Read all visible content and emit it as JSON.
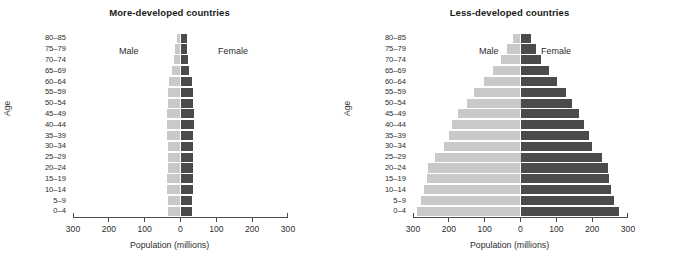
{
  "figure": {
    "axis_title_x": "Population (millions)",
    "axis_title_y": "Age",
    "series_labels": {
      "male": "Male",
      "female": "Female"
    },
    "colors": {
      "male": "#c9c9c9",
      "female": "#4b4b4b",
      "axis": "#4d4d4d",
      "text": "#2d2d2d",
      "background": "#ffffff"
    }
  },
  "panels": [
    {
      "id": "more-developed",
      "title": "More-developed countries"
    },
    {
      "id": "less-developed",
      "title": "Less-developed countries"
    }
  ],
  "axis": {
    "tick_labels": [
      "300",
      "200",
      "100",
      "0",
      "100",
      "200",
      "300"
    ],
    "tick_values": [
      -300,
      -200,
      -100,
      0,
      100,
      200,
      300
    ],
    "min": -300,
    "max": 300
  },
  "age_groups": [
    "80–85",
    "75–79",
    "70–74",
    "65–69",
    "60–64",
    "55–59",
    "50–54",
    "45–49",
    "40–44",
    "35–39",
    "30–34",
    "25–29",
    "20–24",
    "15–19",
    "10–14",
    "5–9",
    "0–4"
  ],
  "chart_data": [
    {
      "type": "bar",
      "orientation": "horizontal",
      "layout": "population-pyramid",
      "title": "More-developed countries",
      "xlabel": "Population (millions)",
      "ylabel": "Age",
      "xlim": [
        -300,
        300
      ],
      "xticks": [
        -300,
        -200,
        -100,
        0,
        100,
        200,
        300
      ],
      "xticklabels": [
        "300",
        "200",
        "100",
        "0",
        "100",
        "200",
        "300"
      ],
      "grid": false,
      "legend": "in-plot text labels",
      "categories": [
        "80–85",
        "75–79",
        "70–74",
        "65–69",
        "60–64",
        "55–59",
        "50–54",
        "45–49",
        "40–44",
        "35–39",
        "30–34",
        "25–29",
        "20–24",
        "15–19",
        "10–14",
        "5–9",
        "0–4"
      ],
      "series": [
        {
          "name": "Male",
          "side": "left",
          "color": "#c9c9c9",
          "values": [
            10,
            14,
            19,
            23,
            31,
            36,
            36,
            39,
            39,
            38,
            36,
            36,
            36,
            37,
            37,
            35,
            35
          ]
        },
        {
          "name": "Female",
          "side": "right",
          "color": "#4b4b4b",
          "values": [
            17,
            19,
            22,
            25,
            32,
            36,
            36,
            38,
            37,
            36,
            35,
            35,
            35,
            35,
            35,
            33,
            33
          ]
        }
      ]
    },
    {
      "type": "bar",
      "orientation": "horizontal",
      "layout": "population-pyramid",
      "title": "Less-developed countries",
      "xlabel": "Population (millions)",
      "ylabel": "Age",
      "xlim": [
        -300,
        300
      ],
      "xticks": [
        -300,
        -200,
        -100,
        0,
        100,
        200,
        300
      ],
      "xticklabels": [
        "300",
        "200",
        "100",
        "0",
        "100",
        "200",
        "300"
      ],
      "grid": false,
      "legend": "in-plot text labels",
      "categories": [
        "80–85",
        "75–79",
        "70–74",
        "65–69",
        "60–64",
        "55–59",
        "50–54",
        "45–49",
        "40–44",
        "35–39",
        "30–34",
        "25–29",
        "20–24",
        "15–19",
        "10–14",
        "5–9",
        "0–4"
      ],
      "series": [
        {
          "name": "Male",
          "side": "left",
          "color": "#c9c9c9",
          "values": [
            22,
            38,
            55,
            78,
            103,
            130,
            150,
            175,
            190,
            200,
            213,
            240,
            258,
            262,
            268,
            278,
            290
          ]
        },
        {
          "name": "Female",
          "side": "right",
          "color": "#4b4b4b",
          "values": [
            30,
            42,
            58,
            80,
            103,
            128,
            145,
            163,
            178,
            190,
            200,
            228,
            243,
            248,
            252,
            262,
            275
          ]
        }
      ]
    }
  ]
}
